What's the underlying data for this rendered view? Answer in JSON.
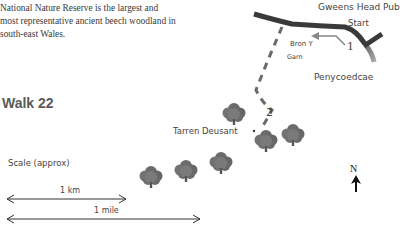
{
  "intro_text": "National Nature Reserve is the largest and most representative ancient beech woodland in south-east Wales.",
  "intro_lines": [
    "National Nature Reserve is the largest and",
    "most representative ancient beech woodland in",
    "south-east Wales."
  ],
  "walk_title": "Walk 22",
  "labels": {
    "pub": "Gweens Head Pub",
    "start": "Start",
    "bron_y_garn_1": "Bron Y",
    "bron_y_garn_2": "Garn",
    "penycoedcae": "Penycoedcae",
    "tarren_deusant": "Tarren Deusant",
    "waypoint_1": "1",
    "waypoint_2": "2"
  },
  "scale": {
    "title": "Scale (approx)",
    "km_label": "1 km",
    "mile_label": "1 mile"
  },
  "compass": {
    "label": "N",
    "icon": "north-arrow-icon"
  },
  "colors": {
    "road": "#3a3a3a",
    "path": "#6a6a6a",
    "tree": "#6b6b6b",
    "text": "#444444"
  }
}
